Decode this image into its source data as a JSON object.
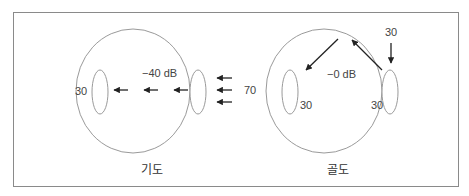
{
  "diagram": {
    "air_conduction": {
      "caption": "기도",
      "attenuation_label": "−40 dB",
      "input_level": "70",
      "far_ear_level": "30"
    },
    "bone_conduction": {
      "caption": "골도",
      "attenuation_label": "−0 dB",
      "input_level": "30",
      "left_ear_level": "30",
      "right_ear_level": "30"
    },
    "colors": {
      "outline": "#9a9a9a",
      "arrow": "#222222",
      "frame": "#8a8a8a",
      "text": "#444444"
    }
  }
}
